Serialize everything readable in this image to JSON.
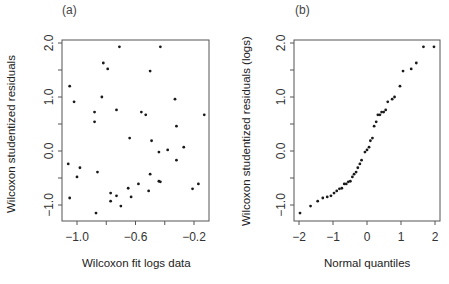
{
  "panels": {
    "a": {
      "tag": "(a)",
      "xlabel": "Wilcoxon fit logs data",
      "ylabel": "Wilcoxon studentized residuals",
      "xticks": [
        "-1.0",
        "-0.6",
        "-0.2"
      ],
      "yticks": [
        "-1.0",
        "0.0",
        "1.0",
        "2.0"
      ]
    },
    "b": {
      "tag": "(b)",
      "xlabel": "Normal quantiles",
      "ylabel": "Wilcoxon studentized residuals (logs)",
      "xticks": [
        "-2",
        "-1",
        "0",
        "1",
        "2"
      ],
      "yticks": [
        "-1.0",
        "0.0",
        "1.0",
        "2.0"
      ]
    }
  },
  "chart_data": [
    {
      "type": "scatter",
      "title": "(a)",
      "xlabel": "Wilcoxon fit logs data",
      "ylabel": "Wilcoxon studentized residuals",
      "xlim": [
        -1.1,
        -0.1
      ],
      "ylim": [
        -1.3,
        2.0
      ],
      "xticks": [
        -1.0,
        -0.8,
        -0.6,
        -0.4,
        -0.2
      ],
      "xticklabels": [
        "-1.0",
        "",
        "-0.6",
        "",
        "-0.2"
      ],
      "yticks": [
        -1.0,
        -0.5,
        0.0,
        0.5,
        1.0,
        1.5,
        2.0
      ],
      "yticklabels": [
        "-1.0",
        "",
        "0.0",
        "",
        "1.0",
        "",
        "2.0"
      ],
      "grid": false,
      "points": [
        [
          -0.71,
          1.93
        ],
        [
          -0.82,
          1.63
        ],
        [
          -0.79,
          1.52
        ],
        [
          -1.05,
          1.2
        ],
        [
          -0.83,
          1.0
        ],
        [
          -1.02,
          0.91
        ],
        [
          -0.88,
          0.72
        ],
        [
          -0.73,
          0.76
        ],
        [
          -0.88,
          0.54
        ],
        [
          -0.43,
          1.93
        ],
        [
          -0.5,
          1.48
        ],
        [
          -0.33,
          0.96
        ],
        [
          -0.56,
          0.72
        ],
        [
          -0.53,
          0.67
        ],
        [
          -0.13,
          0.67
        ],
        [
          -0.32,
          0.46
        ],
        [
          -0.64,
          0.24
        ],
        [
          -0.49,
          0.19
        ],
        [
          -0.27,
          0.07
        ],
        [
          -0.44,
          -0.02
        ],
        [
          -0.38,
          0.02
        ],
        [
          -0.32,
          -0.17
        ],
        [
          -1.06,
          -0.24
        ],
        [
          -0.98,
          -0.31
        ],
        [
          -0.86,
          -0.39
        ],
        [
          -1.0,
          -0.48
        ],
        [
          -0.5,
          -0.43
        ],
        [
          -0.44,
          -0.56
        ],
        [
          -0.43,
          -0.57
        ],
        [
          -0.58,
          -0.61
        ],
        [
          -0.65,
          -0.69
        ],
        [
          -0.17,
          -0.61
        ],
        [
          -0.21,
          -0.7
        ],
        [
          -0.51,
          -0.74
        ],
        [
          -0.77,
          -0.78
        ],
        [
          -0.73,
          -0.83
        ],
        [
          -0.63,
          -0.85
        ],
        [
          -1.05,
          -0.87
        ],
        [
          -0.77,
          -0.93
        ],
        [
          -0.7,
          -1.02
        ],
        [
          -0.87,
          -1.15
        ]
      ]
    },
    {
      "type": "scatter",
      "title": "(b)",
      "xlabel": "Normal quantiles",
      "ylabel": "Wilcoxon studentized residuals (logs)",
      "xlim": [
        -2.15,
        2.15
      ],
      "ylim": [
        -1.3,
        2.0
      ],
      "xticks": [
        -2,
        -1,
        0,
        1,
        2
      ],
      "xticklabels": [
        "-2",
        "-1",
        "0",
        "1",
        "2"
      ],
      "yticks": [
        -1.0,
        -0.5,
        0.0,
        0.5,
        1.0,
        1.5,
        2.0
      ],
      "yticklabels": [
        "-1.0",
        "",
        "0.0",
        "",
        "1.0",
        "",
        "2.0"
      ],
      "grid": false,
      "points": [
        [
          -1.97,
          -1.15
        ],
        [
          -1.66,
          -1.02
        ],
        [
          -1.45,
          -0.93
        ],
        [
          -1.3,
          -0.87
        ],
        [
          -1.17,
          -0.85
        ],
        [
          -1.06,
          -0.83
        ],
        [
          -0.97,
          -0.78
        ],
        [
          -0.89,
          -0.74
        ],
        [
          -0.81,
          -0.7
        ],
        [
          -0.74,
          -0.69
        ],
        [
          -0.67,
          -0.61
        ],
        [
          -0.61,
          -0.61
        ],
        [
          -0.55,
          -0.57
        ],
        [
          -0.49,
          -0.56
        ],
        [
          -0.43,
          -0.48
        ],
        [
          -0.38,
          -0.43
        ],
        [
          -0.32,
          -0.39
        ],
        [
          -0.27,
          -0.31
        ],
        [
          -0.21,
          -0.24
        ],
        [
          -0.16,
          -0.17
        ],
        [
          -0.06,
          -0.02
        ],
        [
          0.0,
          0.02
        ],
        [
          0.06,
          0.07
        ],
        [
          0.1,
          0.19
        ],
        [
          0.16,
          0.24
        ],
        [
          0.21,
          0.46
        ],
        [
          0.27,
          0.54
        ],
        [
          0.32,
          0.67
        ],
        [
          0.38,
          0.67
        ],
        [
          0.43,
          0.72
        ],
        [
          0.49,
          0.72
        ],
        [
          0.55,
          0.76
        ],
        [
          0.61,
          0.91
        ],
        [
          0.74,
          0.96
        ],
        [
          0.81,
          1.0
        ],
        [
          0.97,
          1.2
        ],
        [
          1.06,
          1.48
        ],
        [
          1.3,
          1.52
        ],
        [
          1.45,
          1.63
        ],
        [
          1.66,
          1.93
        ],
        [
          1.97,
          1.93
        ]
      ]
    }
  ]
}
